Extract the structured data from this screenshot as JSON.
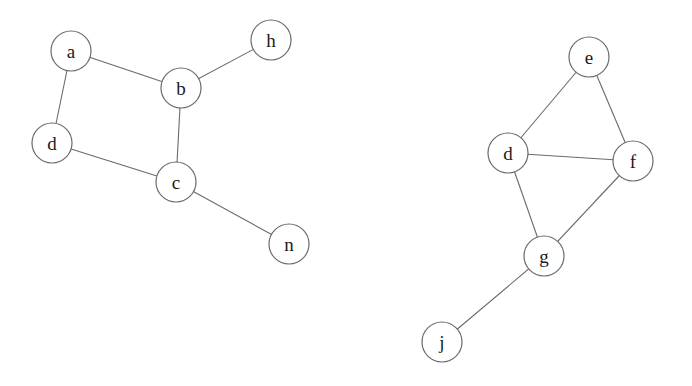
{
  "diagram": {
    "type": "undirected-graph",
    "graphs": [
      {
        "id": "left-graph",
        "nodes": [
          {
            "id": "a",
            "label": "a",
            "x": 71,
            "y": 51
          },
          {
            "id": "b",
            "label": "b",
            "x": 181,
            "y": 88
          },
          {
            "id": "h",
            "label": "h",
            "x": 271,
            "y": 40
          },
          {
            "id": "d",
            "label": "d",
            "x": 52,
            "y": 143
          },
          {
            "id": "c",
            "label": "c",
            "x": 176,
            "y": 182
          },
          {
            "id": "n",
            "label": "n",
            "x": 289,
            "y": 244
          }
        ],
        "edges": [
          [
            "a",
            "b"
          ],
          [
            "a",
            "d"
          ],
          [
            "b",
            "h"
          ],
          [
            "b",
            "c"
          ],
          [
            "d",
            "c"
          ],
          [
            "c",
            "n"
          ]
        ]
      },
      {
        "id": "right-graph",
        "nodes": [
          {
            "id": "e",
            "label": "e",
            "x": 589,
            "y": 57
          },
          {
            "id": "d",
            "label": "d",
            "x": 508,
            "y": 153
          },
          {
            "id": "f",
            "label": "f",
            "x": 633,
            "y": 161
          },
          {
            "id": "g",
            "label": "g",
            "x": 544,
            "y": 256
          },
          {
            "id": "j",
            "label": "j",
            "x": 442,
            "y": 342
          }
        ],
        "edges": [
          [
            "e",
            "d"
          ],
          [
            "e",
            "f"
          ],
          [
            "d",
            "f"
          ],
          [
            "d",
            "g"
          ],
          [
            "f",
            "g"
          ],
          [
            "g",
            "j"
          ]
        ]
      }
    ],
    "node_radius": 20,
    "colors": {
      "stroke": "#6a6a6a",
      "label": "#1a1a1a",
      "background": "#ffffff"
    }
  }
}
